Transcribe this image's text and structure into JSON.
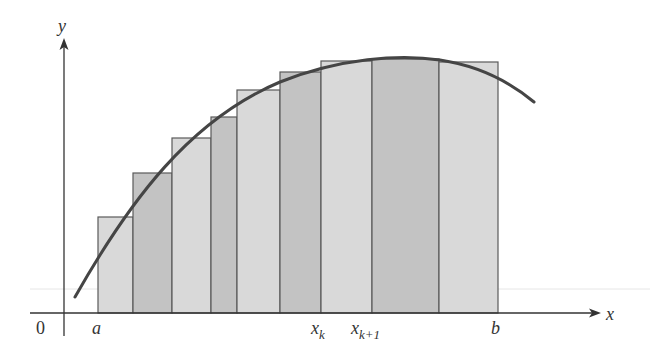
{
  "figure": {
    "type": "riemann-sum-diagram"
  },
  "axes": {
    "x_label": "x",
    "y_label": "y",
    "origin_label": "0",
    "origin_px": [
      64,
      313
    ],
    "x_axis_end_px": 601,
    "y_axis_top_px": 38
  },
  "labels": {
    "a": "a",
    "b": "b",
    "xk_base": "x",
    "xk_sub": "k",
    "xk1_base": "x",
    "xk1_sub": "k+1"
  },
  "colors": {
    "light_fill": "#d9d9d9",
    "dark_fill": "#c3c3c3",
    "rect_stroke": "#5a5a5a",
    "curve": "#454545",
    "axis": "#333333",
    "faint_line": "#e6e6e6"
  },
  "rectangles": [
    {
      "x0": 98,
      "x1": 133,
      "top": 217,
      "shade": "light"
    },
    {
      "x0": 133,
      "x1": 172,
      "top": 173,
      "shade": "dark"
    },
    {
      "x0": 172,
      "x1": 211,
      "top": 138,
      "shade": "light"
    },
    {
      "x0": 211,
      "x1": 237,
      "top": 117,
      "shade": "dark"
    },
    {
      "x0": 237,
      "x1": 280,
      "top": 90,
      "shade": "light"
    },
    {
      "x0": 280,
      "x1": 321,
      "top": 72,
      "shade": "dark"
    },
    {
      "x0": 321,
      "x1": 372,
      "top": 61,
      "shade": "light"
    },
    {
      "x0": 372,
      "x1": 439,
      "top": 59,
      "shade": "dark"
    },
    {
      "x0": 439,
      "x1": 498,
      "top": 62,
      "shade": "light"
    }
  ],
  "curve": {
    "start": [
      75,
      297
    ],
    "path": "M75,297 C130,200 190,120 280,82 C340,58 400,54 440,60 C480,66 510,82 534,102"
  }
}
